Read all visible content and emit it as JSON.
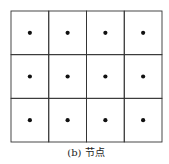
{
  "diagram": {
    "rows": 3,
    "cols": 4,
    "node_marker": "filled-dot",
    "line_color": "#333333",
    "dot_color": "#111111",
    "caption": "(b) 节点"
  }
}
